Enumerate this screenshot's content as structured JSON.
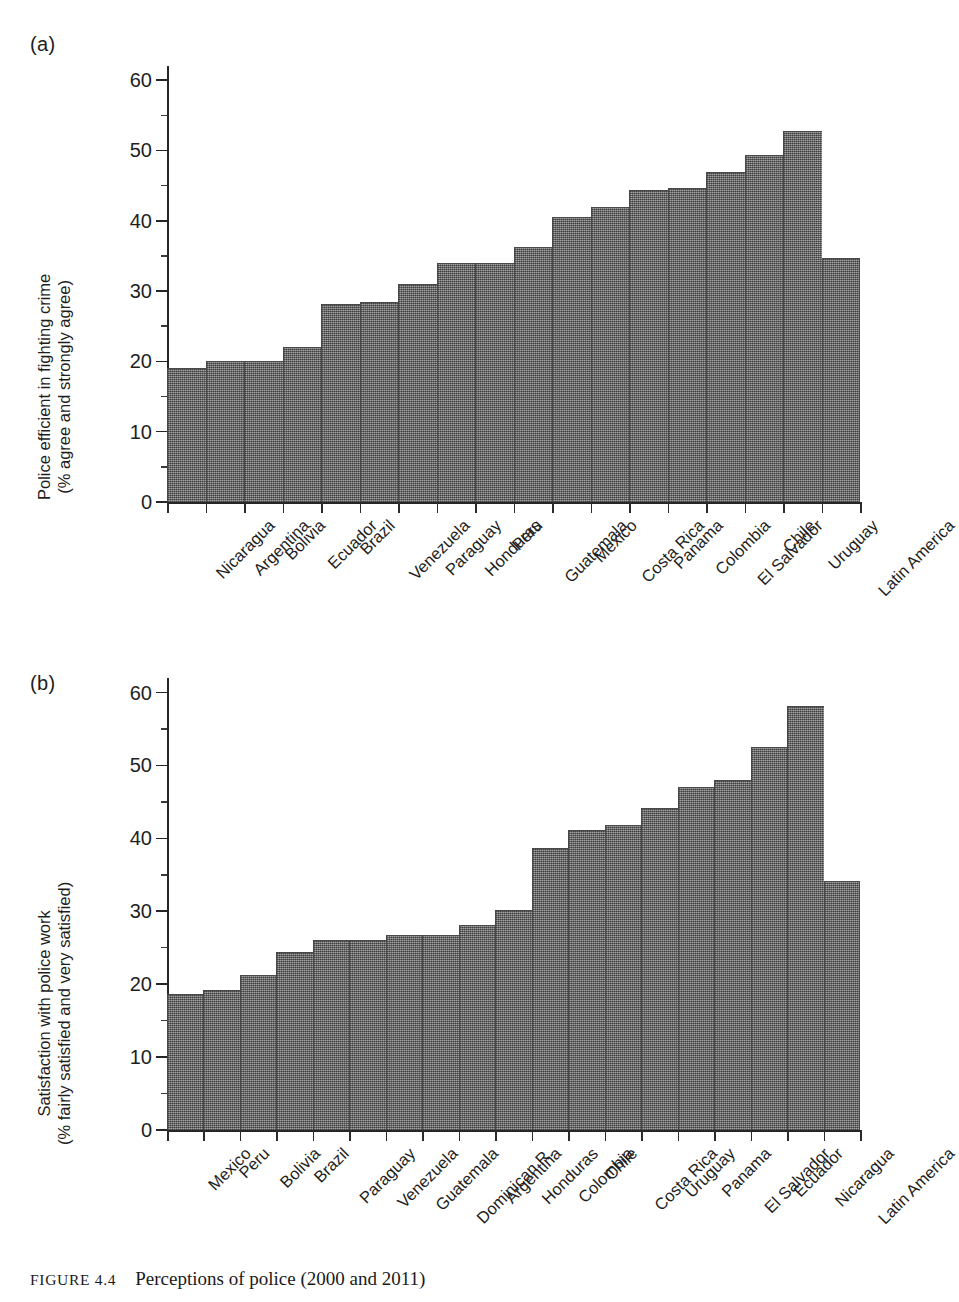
{
  "figure": {
    "label": "FIGURE 4.4",
    "title": "Perceptions of police (2000 and 2011)"
  },
  "panels": [
    {
      "letter": "(a)",
      "ylabel_line1": "Police efficient in fighting crime",
      "ylabel_line2": "(% agree and strongly agree)"
    },
    {
      "letter": "(b)",
      "ylabel_line1": "Satisfaction with police work",
      "ylabel_line2": "(% fairly satisfied and very satisfied)"
    }
  ],
  "chart_data": [
    {
      "type": "bar",
      "panel": "(a)",
      "title": "Police efficient in fighting crime (% agree and strongly agree)",
      "xlabel": "",
      "ylabel": "Police efficient in fighting crime (% agree and strongly agree)",
      "ylim": [
        0,
        62
      ],
      "yticks": [
        0,
        10,
        20,
        30,
        40,
        50,
        60
      ],
      "ytick_labels": [
        "0",
        "10",
        "20",
        "30",
        "40",
        "50",
        "60"
      ],
      "minor_tick_step": 5,
      "grid": false,
      "legend": "none",
      "bar_color": "#7d7d7d",
      "categories": [
        "Nicaragua",
        "Argentina",
        "Bolivia",
        "Ecuador",
        "Brazil",
        "Venezuela",
        "Paraguay",
        "Honduras",
        "Peru",
        "Guatemala",
        "Mexico",
        "Costa Rica",
        "Panama",
        "Colombia",
        "El Salvador",
        "Chile",
        "Uruguay",
        "Latin America"
      ],
      "values": [
        19.1,
        20.0,
        20.0,
        22.1,
        28.1,
        28.4,
        31.0,
        34.0,
        34.0,
        36.2,
        40.5,
        41.9,
        44.3,
        44.6,
        46.9,
        49.3,
        52.8,
        34.7
      ]
    },
    {
      "type": "bar",
      "panel": "(b)",
      "title": "Satisfaction with police work (% fairly satisfied and very satisfied)",
      "xlabel": "",
      "ylabel": "Satisfaction with police work (% fairly satisfied and very satisfied)",
      "ylim": [
        0,
        62
      ],
      "yticks": [
        0,
        10,
        20,
        30,
        40,
        50,
        60
      ],
      "ytick_labels": [
        "0",
        "10",
        "20",
        "30",
        "40",
        "50",
        "60"
      ],
      "minor_tick_step": 5,
      "grid": false,
      "legend": "none",
      "bar_color": "#7d7d7d",
      "categories": [
        "Mexico",
        "Peru",
        "Bolivia",
        "Brazil",
        "Paraguay",
        "Venezuela",
        "Guatemala",
        "Dominican R.",
        "Argentina",
        "Honduras",
        "Colombia",
        "Chile",
        "Costa Rica",
        "Uruguay",
        "Panama",
        "El Salvador",
        "Ecuador",
        "Nicaragua",
        "Latin America"
      ],
      "values": [
        18.6,
        19.2,
        21.2,
        24.4,
        26.1,
        26.1,
        26.8,
        26.8,
        28.1,
        30.2,
        38.7,
        41.2,
        41.9,
        44.2,
        47.1,
        48.0,
        52.6,
        58.1,
        34.2
      ]
    }
  ]
}
